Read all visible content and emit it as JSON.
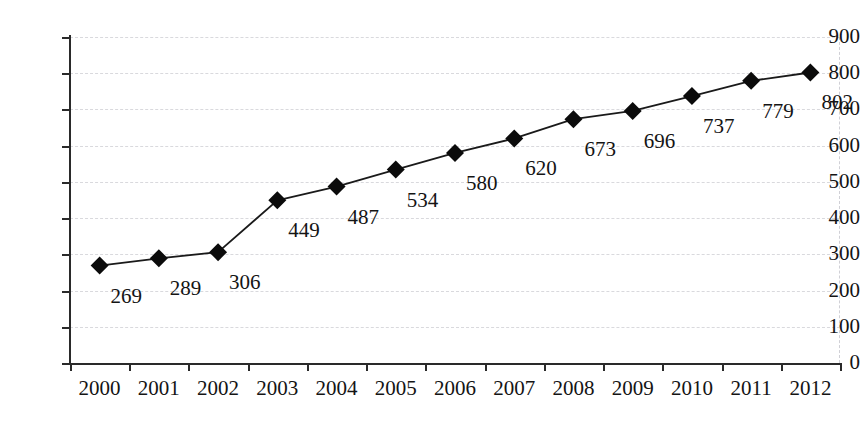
{
  "chart_data": {
    "type": "line",
    "title": "",
    "subtitle": "",
    "xlabel": "",
    "ylabel": "",
    "categories": [
      "2000",
      "2001",
      "2002",
      "2003",
      "2004",
      "2005",
      "2006",
      "2007",
      "2008",
      "2009",
      "2010",
      "2011",
      "2012"
    ],
    "values": [
      269,
      289,
      306,
      449,
      487,
      534,
      580,
      620,
      673,
      696,
      737,
      779,
      802
    ],
    "series": [
      {
        "name": "",
        "values": [
          269,
          289,
          306,
          449,
          487,
          534,
          580,
          620,
          673,
          696,
          737,
          779,
          802
        ]
      }
    ],
    "data_labels": [
      "269",
      "289",
      "306",
      "449",
      "487",
      "534",
      "580",
      "620",
      "673",
      "696",
      "737",
      "779",
      "802"
    ],
    "ylim": [
      0,
      900
    ],
    "y_ticks": [
      0,
      100,
      200,
      300,
      400,
      500,
      600,
      700,
      800,
      900
    ],
    "y_tick_labels": [
      "0",
      "100",
      "200",
      "300",
      "400",
      "500",
      "600",
      "700",
      "800",
      "900"
    ],
    "grid": true,
    "grid_axis": "y",
    "grid_style": "dashed",
    "legend": false,
    "legend_position": "none",
    "marker": "diamond",
    "colors": {
      "line": "#1a1a1a",
      "marker": "#0b0b0b",
      "grid": "#d9d9dd",
      "axis": "#2a2a2a",
      "text": "#141414",
      "background": "#ffffff"
    }
  }
}
